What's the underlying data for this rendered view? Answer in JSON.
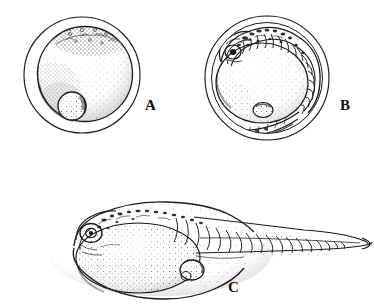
{
  "figure": {
    "kind": "scientific-line-drawing",
    "background_color": "#ffffff",
    "ink_color": "#1a1a1a",
    "canvas": {
      "width": 374,
      "height": 308
    }
  },
  "panels": [
    {
      "id": "A",
      "label": "A",
      "label_position": {
        "x": 145,
        "y": 110
      },
      "title": "egg with blastoderm and oil globule",
      "geometry": {
        "chorion": {
          "cx": 82,
          "cy": 75,
          "rx": 58,
          "ry": 58
        },
        "yolk": {
          "cx": 85,
          "cy": 74,
          "rx": 48,
          "ry": 47
        },
        "oil_globule": {
          "cx": 72,
          "cy": 106,
          "rx": 14,
          "ry": 14
        },
        "blastoderm_cap": {
          "cx": 92,
          "cy": 40,
          "rx": 38,
          "ry": 16
        }
      }
    },
    {
      "id": "B",
      "label": "B",
      "label_position": {
        "x": 340,
        "y": 110
      },
      "title": "curled embryo inside chorion with myomeres",
      "geometry": {
        "chorion": {
          "cx": 267,
          "cy": 78,
          "rx": 62,
          "ry": 62
        },
        "inner_membrane": {
          "cx": 267,
          "cy": 78,
          "rx": 55,
          "ry": 55
        },
        "yolk": {
          "cx": 262,
          "cy": 83,
          "rx": 46,
          "ry": 40
        },
        "oil_globule": {
          "cx": 263,
          "cy": 110,
          "rx": 10,
          "ry": 7
        },
        "somite_count": 16
      }
    },
    {
      "id": "C",
      "label": "C",
      "label_position": {
        "x": 228,
        "y": 292
      },
      "title": "hatched yolk-sac larva, lateral view",
      "geometry": {
        "body_outline": {
          "cx": 160,
          "cy": 252,
          "rx": 112,
          "ry": 44
        },
        "yolk_sac": {
          "cx": 138,
          "cy": 258,
          "rx": 62,
          "ry": 35
        },
        "eye": {
          "cx": 91,
          "cy": 233,
          "rx": 11,
          "ry": 9
        },
        "oil_globule": {
          "cx": 192,
          "cy": 270,
          "rx": 12,
          "ry": 10
        },
        "tail_tip": {
          "x": 362,
          "y": 242
        },
        "somite_count": 22
      }
    }
  ],
  "labels": {
    "a": "A",
    "b": "B",
    "c": "C"
  }
}
